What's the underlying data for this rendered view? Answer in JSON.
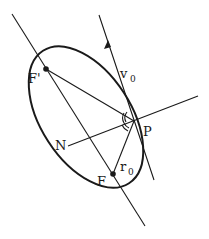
{
  "figure": {
    "labels": {
      "focus_secondary": "F'",
      "focus_primary": "F",
      "point": "P",
      "normal": "N",
      "velocity": "v",
      "velocity_sub": "0",
      "radius": "r",
      "radius_sub": "0"
    },
    "colors": {
      "ink": "#1a1a1a",
      "background": "#ffffff"
    }
  }
}
